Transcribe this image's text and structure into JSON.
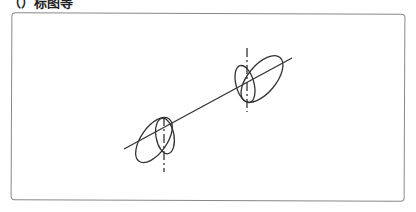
{
  "title": "（）标图等",
  "diagram": {
    "axis_line": {
      "x1": 124,
      "y1": 149,
      "x2": 292,
      "y2": 58
    },
    "left_group": {
      "center_axis_x": 164,
      "vertical_axis": {
        "y1": 117,
        "y2": 172
      },
      "large_ellipse": {
        "cx": 154,
        "cy": 140,
        "rx": 13,
        "ry": 26,
        "rotate": 35
      },
      "small_ellipse": {
        "cx": 165,
        "cy": 136,
        "rx": 9,
        "ry": 18,
        "rotate": -10
      }
    },
    "right_group": {
      "center_axis_x": 247,
      "vertical_axis": {
        "y1": 48,
        "y2": 112
      },
      "large_ellipse": {
        "cx": 262,
        "cy": 79,
        "rx": 14,
        "ry": 28,
        "rotate": 40
      },
      "small_ellipse": {
        "cx": 245,
        "cy": 84,
        "rx": 9,
        "ry": 19,
        "rotate": -15
      }
    },
    "stroke_color": "#333333"
  }
}
